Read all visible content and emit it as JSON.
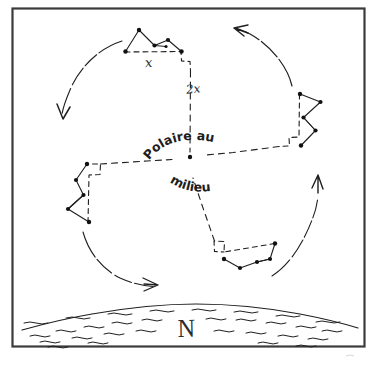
{
  "diagram": {
    "title_hidden": "",
    "center_label_line1": "Polaire au",
    "center_label_line2": "milieu",
    "horizon_label": "N",
    "angle_label_small": "x",
    "angle_label_large": "2x",
    "frame_color": "#3b3b3b",
    "ink_color": "#1f1f1f",
    "background_color": "#ffffff"
  },
  "constellations": [
    {
      "name": "big-dipper-top",
      "position": "top",
      "stars": [
        [
          139,
          30
        ],
        [
          154,
          45
        ],
        [
          125,
          51
        ],
        [
          168,
          40
        ],
        [
          181,
          51
        ],
        [
          166,
          46
        ],
        [
          139,
          50
        ]
      ]
    },
    {
      "name": "big-dipper-right",
      "position": "right",
      "stars": [
        [
          300,
          94
        ],
        [
          320,
          102
        ],
        [
          303,
          117
        ],
        [
          315,
          130
        ],
        [
          301,
          145
        ]
      ]
    },
    {
      "name": "big-dipper-left",
      "position": "left",
      "stars": [
        [
          87,
          164
        ],
        [
          76,
          180
        ],
        [
          83,
          195
        ],
        [
          68,
          209
        ],
        [
          89,
          222
        ]
      ]
    },
    {
      "name": "big-dipper-bottom",
      "position": "bottom",
      "stars": [
        [
          224,
          259
        ],
        [
          240,
          268
        ],
        [
          257,
          262
        ],
        [
          270,
          259
        ],
        [
          275,
          243
        ]
      ]
    }
  ],
  "rotation_arrows": [
    {
      "name": "arrow-top-left",
      "direction": "counterclockwise-down-left"
    },
    {
      "name": "arrow-top-right",
      "direction": "counterclockwise-up-left"
    },
    {
      "name": "arrow-bottom-left",
      "direction": "counterclockwise-right"
    },
    {
      "name": "arrow-bottom-right",
      "direction": "counterclockwise-up"
    }
  ],
  "polaris": {
    "name": "polaris-star",
    "x": 190,
    "y": 157
  }
}
